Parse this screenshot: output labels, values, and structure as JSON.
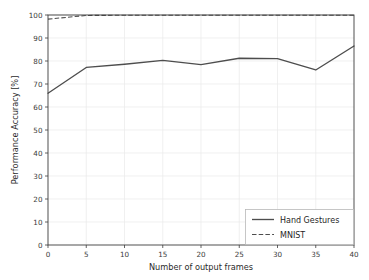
{
  "chart_data": {
    "type": "line",
    "title": "",
    "xlabel": "Number of output frames",
    "ylabel": "Performance Accuracy [%]",
    "xlim": [
      0,
      40
    ],
    "ylim": [
      0,
      100
    ],
    "xticks": [
      0,
      5,
      10,
      15,
      20,
      25,
      30,
      35,
      40
    ],
    "yticks": [
      0,
      10,
      20,
      30,
      40,
      50,
      60,
      70,
      80,
      90,
      100
    ],
    "grid": true,
    "legend_position": "lower right",
    "x": [
      0,
      5,
      10,
      15,
      20,
      25,
      30,
      35,
      40
    ],
    "series": [
      {
        "name": "Hand Gestures",
        "style": "solid",
        "color": "#4d4d4d",
        "values": [
          66.0,
          77.2,
          78.6,
          80.3,
          78.4,
          81.2,
          81.0,
          76.1,
          86.5
        ]
      },
      {
        "name": "MNIST",
        "style": "dashed",
        "color": "#4d4d4d",
        "values": [
          98.2,
          99.8,
          99.9,
          99.9,
          99.9,
          99.9,
          99.9,
          99.9,
          99.9
        ]
      }
    ]
  },
  "legend": {
    "entries": [
      {
        "label": "Hand Gestures",
        "style": "solid"
      },
      {
        "label": "MNIST",
        "style": "dashed"
      }
    ]
  },
  "axes": {
    "x_title": "Number of output frames",
    "y_title": "Performance Accuracy [%]",
    "x_tick_labels": [
      "0",
      "5",
      "10",
      "15",
      "20",
      "25",
      "30",
      "35",
      "40"
    ],
    "y_tick_labels": [
      "0",
      "10",
      "20",
      "30",
      "40",
      "50",
      "60",
      "70",
      "80",
      "90",
      "100"
    ]
  },
  "colors": {
    "line": "#4d4d4d",
    "grid": "#e9e9e9",
    "axis": "#3c3c3c",
    "background": "#ffffff"
  }
}
